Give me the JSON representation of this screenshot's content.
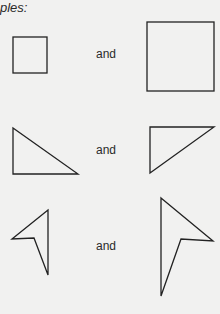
{
  "heading": "ples:",
  "pairs": [
    {
      "connector": "and",
      "left_shape": "small-square",
      "right_shape": "large-square"
    },
    {
      "connector": "and",
      "left_shape": "small-right-triangle",
      "right_shape": "large-right-triangle"
    },
    {
      "connector": "and",
      "left_shape": "small-arrowhead",
      "right_shape": "large-arrowhead"
    }
  ]
}
